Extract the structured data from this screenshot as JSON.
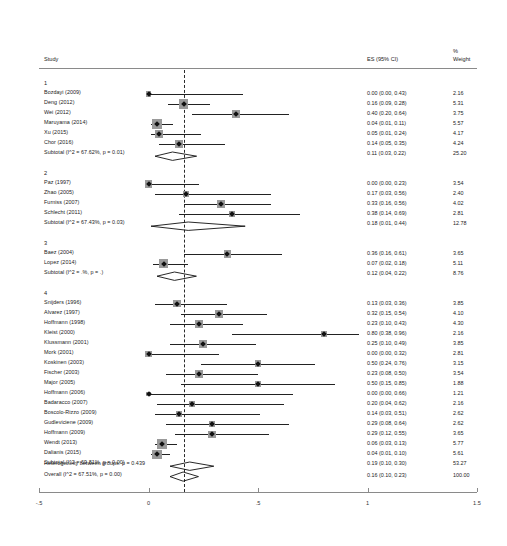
{
  "header": {
    "study_label": "Study",
    "es_label": "ES (95% CI)",
    "weight_pct_label": "%",
    "weight_label": "Weight"
  },
  "axis": {
    "ticks": [
      "-.5",
      "0",
      ".5",
      "1",
      "1.5"
    ],
    "values": [
      -0.5,
      0,
      0.5,
      1,
      1.5
    ],
    "min": -0.5,
    "max": 1.5,
    "null_line_value": 0.16
  },
  "footer": {
    "heterogeneity": "Heterogeneity between groups:  p = 0.439",
    "overall_label": "Overall  (I^2 = 67.51%, p = 0.00)",
    "overall_es": "0.16 (0.10, 0.23)",
    "overall_weight": "100.00"
  },
  "chart_data": {
    "type": "forest",
    "title": "",
    "xlabel": "",
    "xlim": [
      -0.5,
      1.5
    ],
    "null_line": 0.16,
    "columns": [
      "Study",
      "ES (95% CI)",
      "% Weight"
    ],
    "groups": [
      {
        "name": "1",
        "studies": [
          {
            "label": "Bozdayi (2009)",
            "es": 0.0,
            "lo": 0.0,
            "hi": 0.43,
            "es_text": "0.00 (0.00, 0.43)",
            "weight": "2.16",
            "w": 2.16
          },
          {
            "label": "Deng (2012)",
            "es": 0.16,
            "lo": 0.09,
            "hi": 0.28,
            "es_text": "0.16 (0.09, 0.28)",
            "weight": "5.31",
            "w": 5.31
          },
          {
            "label": "Wei (2012)",
            "es": 0.4,
            "lo": 0.2,
            "hi": 0.64,
            "es_text": "0.40 (0.20, 0.64)",
            "weight": "3.75",
            "w": 3.75
          },
          {
            "label": "Maruyama (2014)",
            "es": 0.04,
            "lo": 0.01,
            "hi": 0.11,
            "es_text": "0.04 (0.01, 0.11)",
            "weight": "5.57",
            "w": 5.57
          },
          {
            "label": "Xu (2015)",
            "es": 0.05,
            "lo": 0.01,
            "hi": 0.24,
            "es_text": "0.05 (0.01, 0.24)",
            "weight": "4.17",
            "w": 4.17
          },
          {
            "label": "Chor (2016)",
            "es": 0.14,
            "lo": 0.05,
            "hi": 0.35,
            "es_text": "0.14 (0.05, 0.35)",
            "weight": "4.24",
            "w": 4.24
          }
        ],
        "subtotal": {
          "label": "Subtotal  (I^2 = 67.62%, p = 0.01)",
          "es": 0.11,
          "lo": 0.03,
          "hi": 0.22,
          "es_text": "0.11 (0.03, 0.22)",
          "weight": "25.20"
        }
      },
      {
        "name": "2",
        "studies": [
          {
            "label": "Paz (1997)",
            "es": 0.0,
            "lo": 0.0,
            "hi": 0.23,
            "es_text": "0.00 (0.00, 0.23)",
            "weight": "3.54",
            "w": 3.54
          },
          {
            "label": "Zhao (2005)",
            "es": 0.17,
            "lo": 0.03,
            "hi": 0.56,
            "es_text": "0.17 (0.03, 0.56)",
            "weight": "2.40",
            "w": 2.4
          },
          {
            "label": "Furniss (2007)",
            "es": 0.33,
            "lo": 0.16,
            "hi": 0.56,
            "es_text": "0.33 (0.16, 0.56)",
            "weight": "4.02",
            "w": 4.02
          },
          {
            "label": "Schlecht (2011)",
            "es": 0.38,
            "lo": 0.14,
            "hi": 0.69,
            "es_text": "0.38 (0.14, 0.69)",
            "weight": "2.81",
            "w": 2.81
          }
        ],
        "subtotal": {
          "label": "Subtotal  (I^2 = 67.43%, p = 0.03)",
          "es": 0.18,
          "lo": 0.01,
          "hi": 0.44,
          "es_text": "0.18 (0.01, 0.44)",
          "weight": "12.78"
        }
      },
      {
        "name": "3",
        "studies": [
          {
            "label": "Baez (2004)",
            "es": 0.36,
            "lo": 0.16,
            "hi": 0.61,
            "es_text": "0.36 (0.16, 0.61)",
            "weight": "3.65",
            "w": 3.65
          },
          {
            "label": "Lopez (2014)",
            "es": 0.07,
            "lo": 0.02,
            "hi": 0.18,
            "es_text": "0.07 (0.02, 0.18)",
            "weight": "5.11",
            "w": 5.11
          }
        ],
        "subtotal": {
          "label": "Subtotal  (I^2 = .%, p = .)",
          "es": 0.12,
          "lo": 0.04,
          "hi": 0.22,
          "es_text": "0.12 (0.04, 0.22)",
          "weight": "8.76"
        }
      },
      {
        "name": "4",
        "studies": [
          {
            "label": "Snijders (1996)",
            "es": 0.13,
            "lo": 0.03,
            "hi": 0.36,
            "es_text": "0.13 (0.03, 0.36)",
            "weight": "3.85",
            "w": 3.85
          },
          {
            "label": "Alvarez (1997)",
            "es": 0.32,
            "lo": 0.15,
            "hi": 0.54,
            "es_text": "0.32 (0.15, 0.54)",
            "weight": "4.10",
            "w": 4.1
          },
          {
            "label": "Hoffmann (1998)",
            "es": 0.23,
            "lo": 0.1,
            "hi": 0.43,
            "es_text": "0.23 (0.10, 0.43)",
            "weight": "4.30",
            "w": 4.3
          },
          {
            "label": "Kleist (2000)",
            "es": 0.8,
            "lo": 0.38,
            "hi": 0.96,
            "es_text": "0.80 (0.38, 0.96)",
            "weight": "2.16",
            "w": 2.16
          },
          {
            "label": "Klussmann (2001)",
            "es": 0.25,
            "lo": 0.1,
            "hi": 0.49,
            "es_text": "0.25 (0.10, 0.49)",
            "weight": "3.85",
            "w": 3.85
          },
          {
            "label": "Mork (2001)",
            "es": 0.0,
            "lo": 0.0,
            "hi": 0.32,
            "es_text": "0.00 (0.00, 0.32)",
            "weight": "2.81",
            "w": 2.81
          },
          {
            "label": "Koskinen (2003)",
            "es": 0.5,
            "lo": 0.24,
            "hi": 0.76,
            "es_text": "0.50 (0.24, 0.76)",
            "weight": "3.15",
            "w": 3.15
          },
          {
            "label": "Fischer (2003)",
            "es": 0.23,
            "lo": 0.08,
            "hi": 0.5,
            "es_text": "0.23 (0.08, 0.50)",
            "weight": "3.54",
            "w": 3.54
          },
          {
            "label": "Major (2005)",
            "es": 0.5,
            "lo": 0.15,
            "hi": 0.85,
            "es_text": "0.50 (0.15, 0.85)",
            "weight": "1.88",
            "w": 1.88
          },
          {
            "label": "Hoffmann (2006)",
            "es": 0.0,
            "lo": 0.0,
            "hi": 0.66,
            "es_text": "0.00 (0.00, 0.66)",
            "weight": "1.21",
            "w": 1.21
          },
          {
            "label": "Badaracco (2007)",
            "es": 0.2,
            "lo": 0.04,
            "hi": 0.62,
            "es_text": "0.20 (0.04, 0.62)",
            "weight": "2.16",
            "w": 2.16
          },
          {
            "label": "Boscolo-Rizzo (2009)",
            "es": 0.14,
            "lo": 0.03,
            "hi": 0.51,
            "es_text": "0.14 (0.03, 0.51)",
            "weight": "2.62",
            "w": 2.62
          },
          {
            "label": "Gudleviciene (2009)",
            "es": 0.29,
            "lo": 0.08,
            "hi": 0.64,
            "es_text": "0.29 (0.08, 0.64)",
            "weight": "2.62",
            "w": 2.62
          },
          {
            "label": "Hoffmann (2009)",
            "es": 0.29,
            "lo": 0.12,
            "hi": 0.55,
            "es_text": "0.29 (0.12, 0.55)",
            "weight": "3.65",
            "w": 3.65
          },
          {
            "label": "Wendt (2013)",
            "es": 0.06,
            "lo": 0.03,
            "hi": 0.13,
            "es_text": "0.06 (0.03, 0.13)",
            "weight": "5.77",
            "w": 5.77
          },
          {
            "label": "Dalianis (2015)",
            "es": 0.04,
            "lo": 0.01,
            "hi": 0.1,
            "es_text": "0.04 (0.01, 0.10)",
            "weight": "5.61",
            "w": 5.61
          }
        ],
        "subtotal": {
          "label": "Subtotal  (I^2 = 69.81%, p = 0.00)",
          "es": 0.19,
          "lo": 0.1,
          "hi": 0.3,
          "es_text": "0.19 (0.10, 0.30)",
          "weight": "53.27"
        }
      }
    ],
    "overall": {
      "label": "Overall  (I^2 = 67.51%, p = 0.00)",
      "es": 0.16,
      "lo": 0.1,
      "hi": 0.23,
      "es_text": "0.16 (0.10, 0.23)",
      "weight": "100.00"
    }
  }
}
